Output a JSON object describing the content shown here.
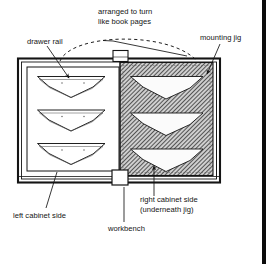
{
  "figure": {
    "kind": "woodworking-assembly-diagram",
    "background_color": "#ffffff",
    "ink_color": "#141414",
    "hatch_color": "#2b2b2b",
    "panel_fill": "#ffffff",
    "jig_fill": "#b7b7b7"
  },
  "annotations": {
    "top_note": {
      "line1": "arranged to turn",
      "line2": "like book pages",
      "pointer": "dashed-arc"
    },
    "drawer_rail": {
      "label": "drawer rail",
      "pointer": "leader-line-down-right"
    },
    "mounting_jig": {
      "label": "mounting jig",
      "pointer": "leader-line-down-left"
    },
    "left_cabinet_side": {
      "label": "left cabinet side",
      "pointer": "leader-line-up-right"
    },
    "workbench": {
      "label": "workbench",
      "pointer": "leader-line-up"
    },
    "right_cabinet_side": {
      "line1": "right cabinet side",
      "line2": "(underneath jig)",
      "pointer": "arrow-up"
    }
  },
  "diagram_parts": {
    "workbench_frame": {
      "name": "workbench",
      "style": "double-outline rectangle"
    },
    "left_panel": {
      "name": "left cabinet side",
      "fill": "white",
      "rail_count": 3
    },
    "right_panel": {
      "name": "mounting jig over right cabinet side",
      "fill": "diagonal hatch",
      "cutout_count": 3
    },
    "hinge_top": {
      "name": "hinge block",
      "position": "top-center"
    },
    "hinge_bottom": {
      "name": "hinge block",
      "position": "bottom-center"
    }
  },
  "page_gutter": {
    "label": "page-edge-bar",
    "color": "#0b0b0b",
    "x": 262
  }
}
